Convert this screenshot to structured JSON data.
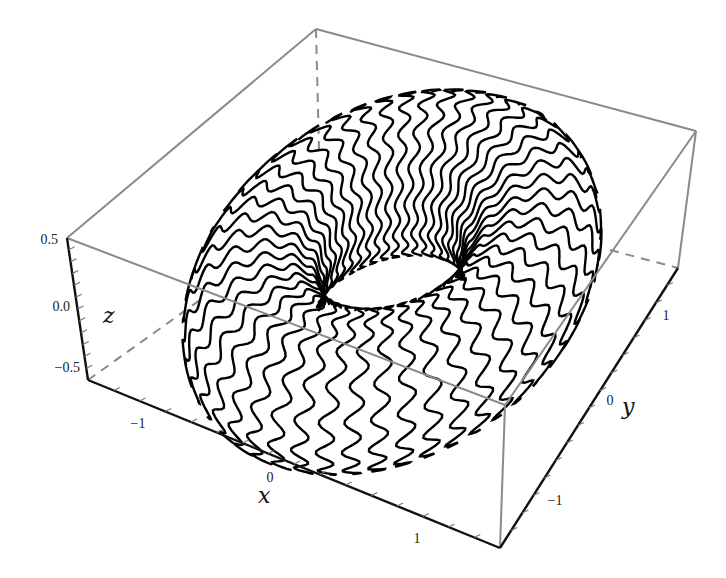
{
  "chart_data": {
    "type": "3d-parametric-curve",
    "title": "",
    "xlabel": "x",
    "ylabel": "y",
    "zlabel": "z",
    "x_ticks": [
      "-1",
      "0",
      "1"
    ],
    "y_ticks": [
      "-1",
      "0",
      "1"
    ],
    "z_ticks": [
      "-0.5",
      "0.0",
      "0.5"
    ],
    "xlim": [
      -1.5,
      1.5
    ],
    "ylim": [
      -1.5,
      1.5
    ],
    "zlim": [
      -0.6,
      0.6
    ],
    "torus": {
      "major_radius": 1.0,
      "minor_radius": 0.5,
      "strand_count": 48
    },
    "box": true,
    "grid": false,
    "legend": null
  },
  "axes": {
    "x": {
      "label": "x",
      "ticks": [
        {
          "text": "−1"
        },
        {
          "text": "0"
        },
        {
          "text": "1"
        }
      ]
    },
    "y": {
      "label": "y",
      "ticks": [
        {
          "text": "−1"
        },
        {
          "text": "0"
        },
        {
          "text": "1"
        }
      ]
    },
    "z": {
      "label": "z",
      "ticks": [
        {
          "text": "0.5"
        },
        {
          "text": "0.0"
        },
        {
          "text": "−0.5"
        }
      ]
    }
  },
  "colors": {
    "curve": "#000000",
    "box_edge": "#808080",
    "axis_edge": "#111111"
  }
}
